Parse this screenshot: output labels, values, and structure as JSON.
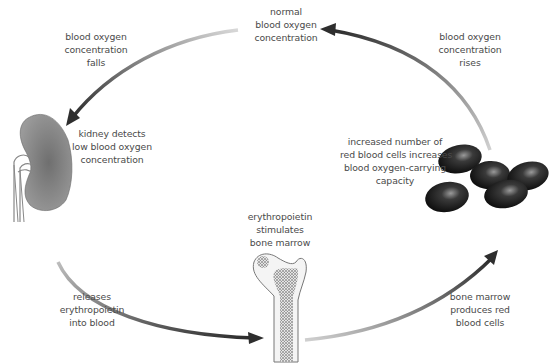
{
  "labels": {
    "normal": [
      "normal",
      "blood oxygen",
      "concentration"
    ],
    "falls": [
      "blood oxygen",
      "concentration",
      "falls"
    ],
    "kidney": [
      "kidney detects",
      "low blood oxygen",
      "concentration"
    ],
    "releases": [
      "releases",
      "erythropoietin",
      "into blood"
    ],
    "stimulates": [
      "erythropoietin",
      "stimulates",
      "bone marrow"
    ],
    "produces": [
      "bone marrow",
      "produces red",
      "blood cells"
    ],
    "increased": [
      "increased number of",
      "red blood cells increases",
      "blood oxygen-carrying",
      "capacity"
    ],
    "rises": [
      "blood oxygen",
      "concentration",
      "rises"
    ]
  },
  "figures": {
    "kidney": "kidney-illustration",
    "bone": "femur-bone-marrow-illustration",
    "cells": "red-blood-cells-illustration"
  },
  "colors": {
    "arrow_dark": "#2e2e2e",
    "arrow_light": "#cfcfcf",
    "kidney": "#8c8c8c",
    "cells": "#1c1c1c",
    "text": "#4a4a4a"
  }
}
